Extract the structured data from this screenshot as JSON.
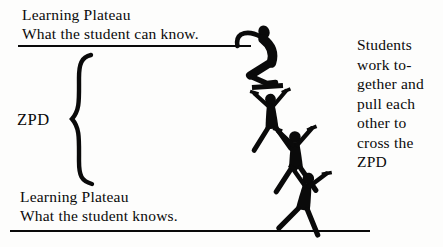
{
  "diagram": {
    "title_meaning": "Zone of Proximal Development diagram",
    "top_plateau": {
      "title": "Learning Plateau",
      "subtitle": "What the student can know."
    },
    "bottom_plateau": {
      "title": "Learning Plateau",
      "subtitle": "What the student knows."
    },
    "zpd_label": "ZPD",
    "side_note": {
      "lines": [
        "Students",
        "work to-",
        "gether and",
        "pull each",
        "other to",
        "cross the",
        "ZPD"
      ]
    },
    "figures": {
      "climber": "climbing-student-silhouette-icon",
      "standers": [
        "student-silhouette-icon",
        "student-silhouette-icon",
        "student-silhouette-icon"
      ],
      "brace": "zpd-range-brace"
    },
    "colors": {
      "ink": "#0a0a0a",
      "background": "#fdfdfc"
    }
  }
}
